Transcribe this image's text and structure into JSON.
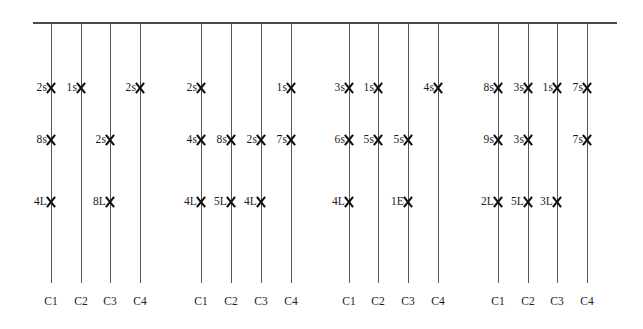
{
  "chart_data": {
    "type": "scatter",
    "title": "",
    "xlabel": "",
    "ylabel": "",
    "grid": false,
    "legend": "none",
    "axis_rail": {
      "orientation": "horizontal",
      "note": "top horizontal rail from which all category drop-lines descend"
    },
    "categories": [
      "C1",
      "C2",
      "C3",
      "C4"
    ],
    "rows": [
      "row-1",
      "row-2",
      "row-3"
    ],
    "groups": [
      {
        "name": "group-1",
        "columns": [
          {
            "category": "C1",
            "markers": [
              {
                "row": 1,
                "label": "2s"
              },
              {
                "row": 2,
                "label": "8s"
              },
              {
                "row": 3,
                "label": "4L"
              }
            ]
          },
          {
            "category": "C2",
            "markers": [
              {
                "row": 1,
                "label": "1s"
              }
            ]
          },
          {
            "category": "C3",
            "markers": [
              {
                "row": 2,
                "label": "2s"
              },
              {
                "row": 3,
                "label": "8L"
              }
            ]
          },
          {
            "category": "C4",
            "markers": [
              {
                "row": 1,
                "label": "2s"
              }
            ]
          }
        ]
      },
      {
        "name": "group-2",
        "columns": [
          {
            "category": "C1",
            "markers": [
              {
                "row": 1,
                "label": "2s"
              },
              {
                "row": 2,
                "label": "4s"
              },
              {
                "row": 3,
                "label": "4L"
              }
            ]
          },
          {
            "category": "C2",
            "markers": [
              {
                "row": 2,
                "label": "8s"
              },
              {
                "row": 3,
                "label": "5L"
              }
            ]
          },
          {
            "category": "C3",
            "markers": [
              {
                "row": 2,
                "label": "2s"
              },
              {
                "row": 3,
                "label": "4L"
              }
            ]
          },
          {
            "category": "C4",
            "markers": [
              {
                "row": 1,
                "label": "1s"
              },
              {
                "row": 2,
                "label": "7s"
              }
            ]
          }
        ]
      },
      {
        "name": "group-3",
        "columns": [
          {
            "category": "C1",
            "markers": [
              {
                "row": 1,
                "label": "3s"
              },
              {
                "row": 2,
                "label": "6s"
              },
              {
                "row": 3,
                "label": "4L"
              }
            ]
          },
          {
            "category": "C2",
            "markers": [
              {
                "row": 1,
                "label": "1s"
              },
              {
                "row": 2,
                "label": "5s"
              }
            ]
          },
          {
            "category": "C3",
            "markers": [
              {
                "row": 2,
                "label": "5s"
              },
              {
                "row": 3,
                "label": "1E"
              }
            ]
          },
          {
            "category": "C4",
            "markers": [
              {
                "row": 1,
                "label": "4s"
              }
            ]
          }
        ]
      },
      {
        "name": "group-4",
        "columns": [
          {
            "category": "C1",
            "markers": [
              {
                "row": 1,
                "label": "8s"
              },
              {
                "row": 2,
                "label": "9s"
              },
              {
                "row": 3,
                "label": "2L"
              }
            ]
          },
          {
            "category": "C2",
            "markers": [
              {
                "row": 1,
                "label": "3s"
              },
              {
                "row": 2,
                "label": "3s"
              },
              {
                "row": 3,
                "label": "5L"
              }
            ]
          },
          {
            "category": "C3",
            "markers": [
              {
                "row": 1,
                "label": "1s"
              },
              {
                "row": 3,
                "label": "3L"
              }
            ]
          },
          {
            "category": "C4",
            "markers": [
              {
                "row": 1,
                "label": "7s"
              },
              {
                "row": 2,
                "label": "7s"
              }
            ]
          }
        ]
      }
    ],
    "colors": {
      "background": "#ffffff",
      "rail": "#4a4a4a",
      "line": "#555555",
      "marker": "#111111",
      "text": "#1c1c1c"
    }
  },
  "geometry": {
    "rail": {
      "x": 33,
      "y": 22,
      "width": 584,
      "height": 2
    },
    "line_top": 24,
    "line_bottom": 283,
    "row_y": [
      88,
      140,
      202
    ],
    "category_label_y": 296,
    "group_x": [
      [
        51,
        81,
        110,
        140
      ],
      [
        201,
        231,
        261,
        291
      ],
      [
        349,
        378,
        408,
        438
      ],
      [
        498,
        528,
        557,
        587
      ]
    ]
  }
}
